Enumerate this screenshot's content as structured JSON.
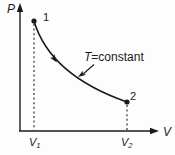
{
  "diagram": {
    "type": "pressure-volume-isotherm",
    "axes": {
      "y_label": "P",
      "x_label": "V"
    },
    "points": [
      {
        "label": "1"
      },
      {
        "label": "2"
      }
    ],
    "x_ticks": [
      {
        "main": "V",
        "sub": "1"
      },
      {
        "main": "V",
        "sub": "2"
      }
    ],
    "annotation": {
      "symbol": "T",
      "rest": "=constant"
    },
    "colors": {
      "line": "#1a1a1a",
      "background": "#fdfdfd"
    }
  }
}
